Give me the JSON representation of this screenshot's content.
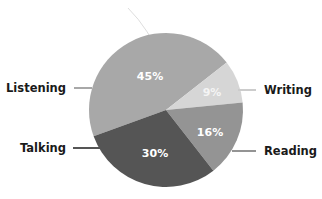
{
  "chart_data": {
    "type": "pie",
    "title": "",
    "categories": [
      "Listening",
      "Writing",
      "Reading",
      "Talking"
    ],
    "values": [
      45,
      9,
      16,
      30
    ],
    "unit": "%",
    "data_labels": [
      "45%",
      "9%",
      "16%",
      "30%"
    ],
    "colors": [
      "#a8a8a8",
      "#d6d6d6",
      "#949494",
      "#555555"
    ],
    "start_angle_deg": 160,
    "direction": "clockwise",
    "legend": "none (leader-line labels outside slices)",
    "center": [
      166,
      110
    ],
    "radius": 77
  },
  "labels": {
    "listening": "Listening",
    "writing": "Writing",
    "reading": "Reading",
    "talking": "Talking"
  },
  "percent_labels": {
    "listening": "45%",
    "writing": "9%",
    "reading": "16%",
    "talking": "30%"
  }
}
